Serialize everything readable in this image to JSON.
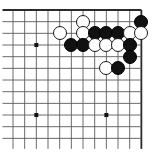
{
  "diagram": {
    "kind": "go-board-position",
    "board": {
      "cols": 12,
      "rows": 12,
      "origin_x": 13,
      "origin_y": 10,
      "spacing": 11.67,
      "line_color": "#5a5a5a",
      "edge_color": "#2b2b2b",
      "background_color": "#ffffff",
      "edges": {
        "top": true,
        "right": true,
        "left": false,
        "bottom": false
      },
      "star_points": [
        {
          "col": 3,
          "row": 4
        },
        {
          "col": 3,
          "row": 10
        },
        {
          "col": 9,
          "row": 10
        }
      ],
      "star_point_color": "#111111",
      "star_point_size": 4
    },
    "stone_colors": {
      "black": "#111111",
      "white": "#ffffff",
      "outline": "#1a1a1a"
    },
    "stone_diameter": 14,
    "stones": [
      {
        "color": "white",
        "col": 7,
        "row": 2,
        "label": "white-stone"
      },
      {
        "color": "black",
        "col": 12,
        "row": 2,
        "label": "black-stone"
      },
      {
        "color": "white",
        "col": 5,
        "row": 3,
        "label": "white-stone"
      },
      {
        "color": "white",
        "col": 7,
        "row": 3,
        "label": "white-stone"
      },
      {
        "color": "black",
        "col": 8,
        "row": 3,
        "label": "black-stone"
      },
      {
        "color": "black",
        "col": 9,
        "row": 3,
        "label": "black-stone"
      },
      {
        "color": "black",
        "col": 10,
        "row": 3,
        "label": "black-stone"
      },
      {
        "color": "white",
        "col": 11,
        "row": 3,
        "label": "white-stone"
      },
      {
        "color": "white",
        "col": 12,
        "row": 3,
        "label": "white-stone"
      },
      {
        "color": "black",
        "col": 6,
        "row": 4,
        "label": "black-stone"
      },
      {
        "color": "black",
        "col": 7,
        "row": 4,
        "label": "black-stone"
      },
      {
        "color": "white",
        "col": 8,
        "row": 4,
        "label": "white-stone"
      },
      {
        "color": "white",
        "col": 9,
        "row": 4,
        "label": "white-stone"
      },
      {
        "color": "white",
        "col": 10,
        "row": 4,
        "label": "white-stone"
      },
      {
        "color": "black",
        "col": 11,
        "row": 4,
        "label": "black-stone"
      },
      {
        "color": "black",
        "col": 11,
        "row": 5,
        "label": "black-stone"
      },
      {
        "color": "white",
        "col": 9,
        "row": 6,
        "label": "white-stone"
      },
      {
        "color": "black",
        "col": 10,
        "row": 6,
        "label": "black-stone"
      }
    ]
  }
}
